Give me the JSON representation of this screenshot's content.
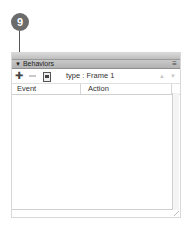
{
  "callout": {
    "number": "9"
  },
  "panel": {
    "title": "Behaviors",
    "collapse_glyph": "▼",
    "menu_glyph": "≡",
    "toolbar": {
      "add_glyph": "✚",
      "type_label": "type : Frame 1",
      "up_glyph": "▲",
      "down_glyph": "▼"
    },
    "columns": [
      "Event",
      "Action"
    ],
    "rows": []
  }
}
